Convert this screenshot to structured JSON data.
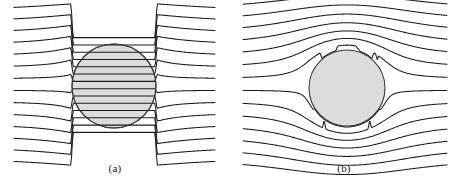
{
  "figure": {
    "background_color": "#ffffff",
    "width": 459,
    "height": 188
  },
  "style": {
    "streamline_color": "#1b1b1b",
    "streamline_width": 1.05,
    "disk_fill_color": "#dcdcdc",
    "disk_stroke_color": "#3a3a3a",
    "disk_stroke_width": 1.1,
    "caption_color": "#1a1a1a",
    "caption_font_size": 11
  },
  "panels": [
    {
      "id": "a",
      "caption": "(a)",
      "origin_x": 0,
      "inclusion_type": "conducting",
      "description": "Field lines converge into and pass through the circular inclusion",
      "lines_pass_through": true,
      "circle": {
        "cx": 114,
        "cy": 86,
        "r": 42
      },
      "field": {
        "x_start": 14,
        "x_end": 215,
        "y_top": 11,
        "y_bottom": 158,
        "n_lines": 14,
        "line_spacing": 11.3,
        "contrast": 1.55,
        "samples": 220
      }
    },
    {
      "id": "b",
      "caption": "(b)",
      "origin_x": 229,
      "inclusion_type": "insulating",
      "description": "Field lines are deflected around the circular inclusion and crowd near its boundary",
      "lines_pass_through": false,
      "circle": {
        "cx": 118,
        "cy": 88,
        "r": 38
      },
      "field": {
        "x_start": 14,
        "x_end": 218,
        "y_top": 11,
        "y_bottom": 158,
        "n_lines": 14,
        "line_spacing": 11.3,
        "contrast": 1.0,
        "samples": 260
      }
    }
  ],
  "chart_data": {
    "type": "line",
    "xlabel": "",
    "ylabel": "",
    "panel_labels": [
      "(a)",
      "(b)"
    ],
    "series": [
      {
        "name": "panel-a-streamlines",
        "n_lines": 14,
        "behavior": "transmitted-through-disk"
      },
      {
        "name": "panel-b-streamlines",
        "n_lines": 14,
        "behavior": "deflected-around-disk"
      }
    ]
  }
}
